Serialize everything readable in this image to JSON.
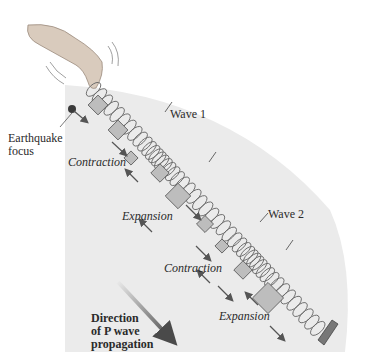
{
  "figure": {
    "type": "P-wave spring analogy diagram",
    "colors": {
      "background": "#ffffff",
      "sector_fill": "#ebebeb",
      "spring_stroke": "#6a6a6a",
      "block_fill": "#bdbdbd",
      "block_stroke": "#555555",
      "arrow_color": "#555555",
      "focus_dot": "#3a3a3a",
      "text": "#2a2a2a"
    },
    "labels": {
      "focus": [
        "Earthquake",
        "focus"
      ],
      "wave1": "Wave 1",
      "wave2": "Wave 2",
      "contraction_1": "Contraction",
      "expansion_1": "Expansion",
      "contraction_2": "Contraction",
      "expansion_2": "Expansion",
      "direction": [
        "Direction",
        "of P wave",
        "propagation"
      ]
    },
    "elements": {
      "hand": "hand-icon",
      "spring": "coil-spring",
      "anchor": "fixed-plate",
      "focus_marker": "earthquake-focus-dot",
      "direction_arrow": "gradient-arrow"
    }
  }
}
